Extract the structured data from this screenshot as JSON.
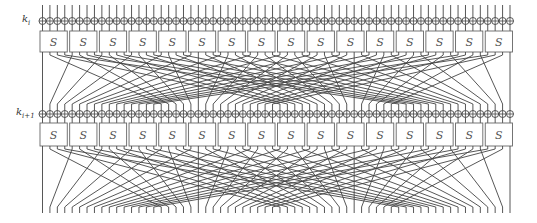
{
  "diagram": {
    "type": "spn-round-diagram",
    "cipher_structure": "PRESENT-style substitution-permutation network",
    "rounds": [
      {
        "key_label_base": "k",
        "key_label_sub": "i"
      },
      {
        "key_label_base": "k",
        "key_label_sub": "i+1"
      }
    ],
    "sbox_label": "S",
    "num_sboxes": 16,
    "bits": 64,
    "permutation_rule": "bit j -> (16*j) mod 63, bit 63 fixed",
    "colors": {
      "line": "#444444",
      "box_stroke": "#666666",
      "box_fill": "#ffffff",
      "text": "#555555"
    }
  }
}
